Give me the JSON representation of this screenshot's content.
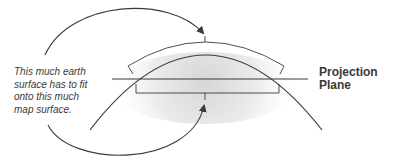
{
  "diagram": {
    "caption_lines": [
      "This much earth",
      "surface has to fit",
      "onto this much",
      "map surface."
    ],
    "plane_label_lines": [
      "Projection",
      "Plane"
    ],
    "elements": {
      "earth_arc": "Curved line representing the earth's surface",
      "projection_plane": "Horizontal line representing the projection plane",
      "earth_surface_bracket": "Curved bracket above the earth arc spanning the earth surface",
      "map_surface_bracket": "Straight bracket below the projection plane spanning the map surface",
      "top_arrow": "Arrow from caption to the curved earth-surface bracket",
      "bottom_arrow": "Arrow from caption to the flat map-surface bracket"
    },
    "colors": {
      "line": "#3a3a3a",
      "shade_center": "#d8d8d8",
      "background": "#ffffff"
    }
  }
}
